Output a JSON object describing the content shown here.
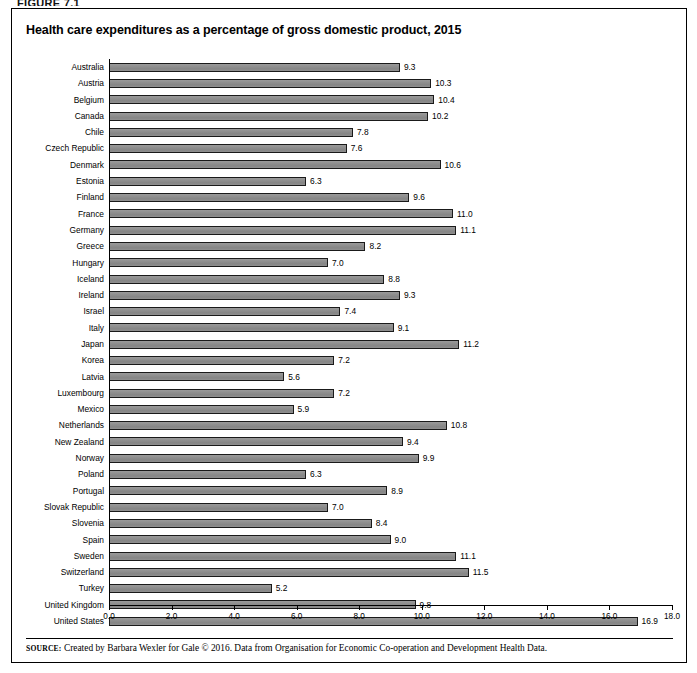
{
  "figure": {
    "label": "FIGURE 7.1"
  },
  "title": "Health care expenditures as a percentage of gross domestic product, 2015",
  "source": {
    "prefix": "SOURCE:",
    "text": "Created by Barbara Wexler for Gale © 2016. Data from Organisation for Economic Co-operation and Development Health Data."
  },
  "colors": {
    "bar_fill": "#8d8d8d",
    "bar_border": "#1a1a1a",
    "text": "#000000",
    "frame": "#000000"
  },
  "chart_data": {
    "type": "bar",
    "orientation": "horizontal",
    "title": "Health care expenditures as a percentage of gross domestic product, 2015",
    "xlabel": "",
    "ylabel": "",
    "xlim": [
      0.0,
      18.0
    ],
    "xticks": [
      "0.0",
      "2.0",
      "4.0",
      "6.0",
      "8.0",
      "10.0",
      "12.0",
      "14.0",
      "16.0",
      "18.0"
    ],
    "xtick_values": [
      0,
      2,
      4,
      6,
      8,
      10,
      12,
      14,
      16,
      18
    ],
    "grid": false,
    "legend": false,
    "data_labels": true,
    "categories": [
      "Australia",
      "Austria",
      "Belgium",
      "Canada",
      "Chile",
      "Czech Republic",
      "Denmark",
      "Estonia",
      "Finland",
      "France",
      "Germany",
      "Greece",
      "Hungary",
      "Iceland",
      "Ireland",
      "Israel",
      "Italy",
      "Japan",
      "Korea",
      "Latvia",
      "Luxembourg",
      "Mexico",
      "Netherlands",
      "New Zealand",
      "Norway",
      "Poland",
      "Portugal",
      "Slovak Republic",
      "Slovenia",
      "Spain",
      "Sweden",
      "Switzerland",
      "Turkey",
      "United Kingdom",
      "United States"
    ],
    "values": [
      9.3,
      10.3,
      10.4,
      10.2,
      7.8,
      7.6,
      10.6,
      6.3,
      9.6,
      11.0,
      11.1,
      8.2,
      7.0,
      8.8,
      9.3,
      7.4,
      9.1,
      11.2,
      7.2,
      5.6,
      7.2,
      5.9,
      10.8,
      9.4,
      9.9,
      6.3,
      8.9,
      7.0,
      8.4,
      9.0,
      11.1,
      11.5,
      5.2,
      9.8,
      16.9
    ],
    "value_labels": [
      "9.3",
      "10.3",
      "10.4",
      "10.2",
      "7.8",
      "7.6",
      "10.6",
      "6.3",
      "9.6",
      "11.0",
      "11.1",
      "8.2",
      "7.0",
      "8.8",
      "9.3",
      "7.4",
      "9.1",
      "11.2",
      "7.2",
      "5.6",
      "7.2",
      "5.9",
      "10.8",
      "9.4",
      "9.9",
      "6.3",
      "8.9",
      "7.0",
      "8.4",
      "9.0",
      "11.1",
      "11.5",
      "5.2",
      "9.8",
      "16.9"
    ]
  }
}
